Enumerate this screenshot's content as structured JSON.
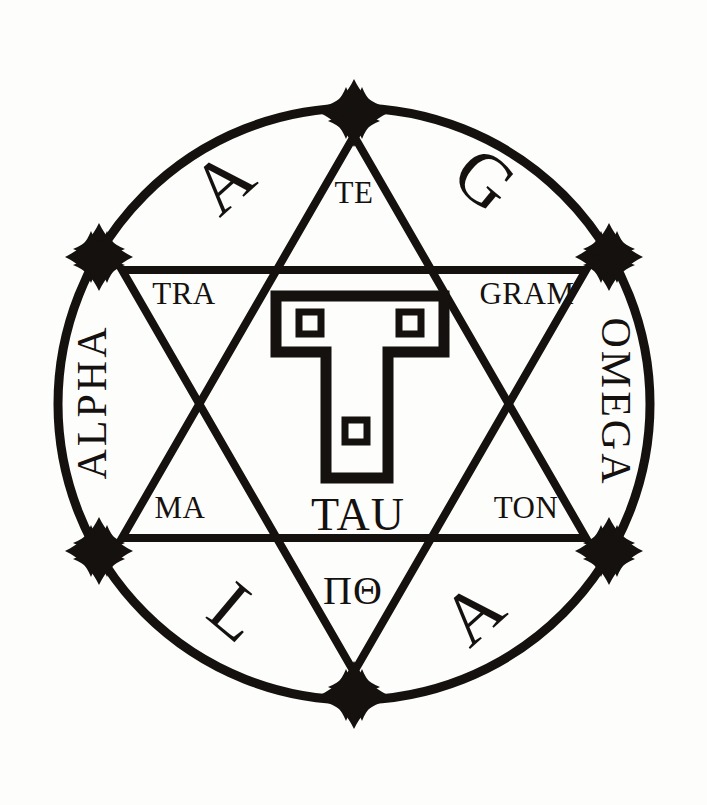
{
  "figure": {
    "background_color": "#fdfdfc",
    "ink_color": "#14110f"
  },
  "geometry": {
    "center_x": 354,
    "center_y": 404,
    "circle_radius": 296,
    "star_radius": 268,
    "circle_stroke_width": 9,
    "triangle_stroke_width": 8,
    "cross_count": 6
  },
  "rim_letters": [
    {
      "id": "rim-a-upper-left",
      "text": "A",
      "x": 228,
      "y": 188,
      "rotation": -42
    },
    {
      "id": "rim-g-upper-right",
      "text": "G",
      "x": 480,
      "y": 185,
      "rotation": 40
    },
    {
      "id": "rim-l-lower-left",
      "text": "L",
      "x": 232,
      "y": 618,
      "rotation": 40
    },
    {
      "id": "rim-a-lower-right",
      "text": "A",
      "x": 478,
      "y": 619,
      "rotation": -42
    }
  ],
  "rim_words": [
    {
      "id": "rim-word-alpha",
      "text": "ALPHA",
      "x": 96,
      "y": 402,
      "rotation": -90
    },
    {
      "id": "rim-word-omega",
      "text": "OMEGA",
      "x": 612,
      "y": 402,
      "rotation": 90
    }
  ],
  "inner_words": [
    {
      "id": "inner-te",
      "text": "TE",
      "x": 354,
      "y": 196
    },
    {
      "id": "inner-tra",
      "text": "TRA",
      "x": 184,
      "y": 297
    },
    {
      "id": "inner-gram",
      "text": "GRAM",
      "x": 527,
      "y": 297
    },
    {
      "id": "inner-ma",
      "text": "MA",
      "x": 180,
      "y": 511
    },
    {
      "id": "inner-ton",
      "text": "TON",
      "x": 526,
      "y": 511
    }
  ],
  "center_labels": {
    "tau_word": {
      "id": "center-tau",
      "text": "TAU",
      "x": 358,
      "y": 519
    },
    "greek": {
      "id": "center-greek",
      "text": "ΠΘ",
      "x": 353,
      "y": 595
    }
  },
  "tau_symbol": {
    "description": "outlined Tau cross with three inset squares",
    "squares": [
      {
        "id": "tau-square-left",
        "x": 299,
        "y": 312,
        "size": 20
      },
      {
        "id": "tau-square-right",
        "x": 399,
        "y": 312,
        "size": 20
      },
      {
        "id": "tau-square-bottom",
        "x": 345,
        "y": 420,
        "size": 20
      }
    ]
  },
  "cross_nodes": [
    {
      "id": "cross-top",
      "angle": 90,
      "label": "top-vertex-cross"
    },
    {
      "id": "cross-upper-right",
      "angle": 30,
      "label": "upper-right-vertex-cross"
    },
    {
      "id": "cross-lower-right",
      "angle": -30,
      "label": "lower-right-vertex-cross"
    },
    {
      "id": "cross-bottom",
      "angle": -90,
      "label": "bottom-vertex-cross"
    },
    {
      "id": "cross-lower-left",
      "angle": 210,
      "label": "lower-left-vertex-cross"
    },
    {
      "id": "cross-upper-left",
      "angle": 150,
      "label": "upper-left-vertex-cross"
    }
  ],
  "reading": {
    "rim_sequence": "A G L A",
    "inner_sequence": "TE TRA GRAM MA TON",
    "full_phrase": "TETRAGRAMMATON",
    "axis_words": "ALPHA OMEGA",
    "center": "TAU ΠΘ"
  }
}
